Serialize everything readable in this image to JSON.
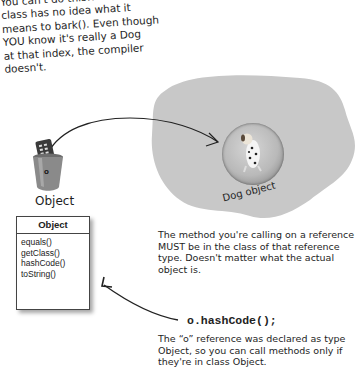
{
  "top_note": {
    "lines": [
      "You can't do this!! The Object",
      "class has no idea what it",
      "means to bark(). Even though",
      "YOU know it's really a Dog",
      "at that index, the compiler",
      "doesn't."
    ]
  },
  "heap": {
    "color": "#c8c8c8",
    "object_label": "Dog object"
  },
  "reference": {
    "variable_name": "o",
    "type_label": "Object"
  },
  "uml_class": {
    "name": "Object",
    "methods": [
      "equals()",
      "getClass()",
      "hashCode()",
      "toString()"
    ]
  },
  "middle_note": {
    "text": "The method you're calling on a reference MUST be in the class of that reference type. Doesn't matter what the actual object is."
  },
  "code_line": "o.hashCode();",
  "bottom_note": {
    "text": "The “o” reference was declared as type Object, so you can call methods only if they're in class Object."
  }
}
